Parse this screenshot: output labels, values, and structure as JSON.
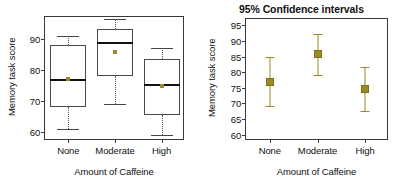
{
  "left_panel": {
    "ylabel": "Memory task score",
    "xlabel": "Amount of Caffeine",
    "yticks": [
      "60",
      "70",
      "80",
      "90"
    ],
    "xticks": [
      "None",
      "Moderate",
      "High"
    ]
  },
  "right_panel": {
    "title": "95% Confidence intervals",
    "ylabel": "Memory task score",
    "xlabel": "Amount of Caffeine",
    "yticks": [
      "60",
      "65",
      "70",
      "75",
      "80",
      "85",
      "90",
      "95"
    ],
    "xticks": [
      "None",
      "Moderate",
      "High"
    ]
  },
  "colors": {
    "marker": "#9a8a22",
    "frame": "#3a3a3a",
    "median": "#111111",
    "whisker": "#555555"
  },
  "chart_data": [
    {
      "type": "box",
      "title": "",
      "xlabel": "Amount of Caffeine",
      "ylabel": "Memory task score",
      "categories": [
        "None",
        "Moderate",
        "High"
      ],
      "ylim": [
        57,
        97
      ],
      "yticks": [
        60,
        70,
        80,
        90
      ],
      "grid": false,
      "legend": "none",
      "boxes": [
        {
          "category": "None",
          "min": 61.0,
          "q1": 68.0,
          "median": 77.0,
          "q3": 88.0,
          "max": 91.0,
          "mean": 77.0
        },
        {
          "category": "Moderate",
          "min": 69.0,
          "q1": 78.0,
          "median": 89.0,
          "q3": 93.0,
          "max": 96.5,
          "mean": 85.7
        },
        {
          "category": "High",
          "min": 59.0,
          "q1": 65.5,
          "median": 75.3,
          "q3": 83.5,
          "max": 87.0,
          "mean": 74.7
        }
      ]
    },
    {
      "type": "scatter",
      "title": "95% Confidence intervals",
      "xlabel": "Amount of Caffeine",
      "ylabel": "Memory task score",
      "categories": [
        "None",
        "Moderate",
        "High"
      ],
      "ylim": [
        58,
        97
      ],
      "yticks": [
        60,
        65,
        70,
        75,
        80,
        85,
        90,
        95
      ],
      "grid": false,
      "legend": "none",
      "errorbars": [
        {
          "category": "None",
          "mean": 77.0,
          "ci_low": 69.3,
          "ci_high": 84.7
        },
        {
          "category": "Moderate",
          "mean": 85.7,
          "ci_low": 79.2,
          "ci_high": 92.3
        },
        {
          "category": "High",
          "mean": 74.6,
          "ci_low": 67.6,
          "ci_high": 81.5
        }
      ]
    }
  ]
}
